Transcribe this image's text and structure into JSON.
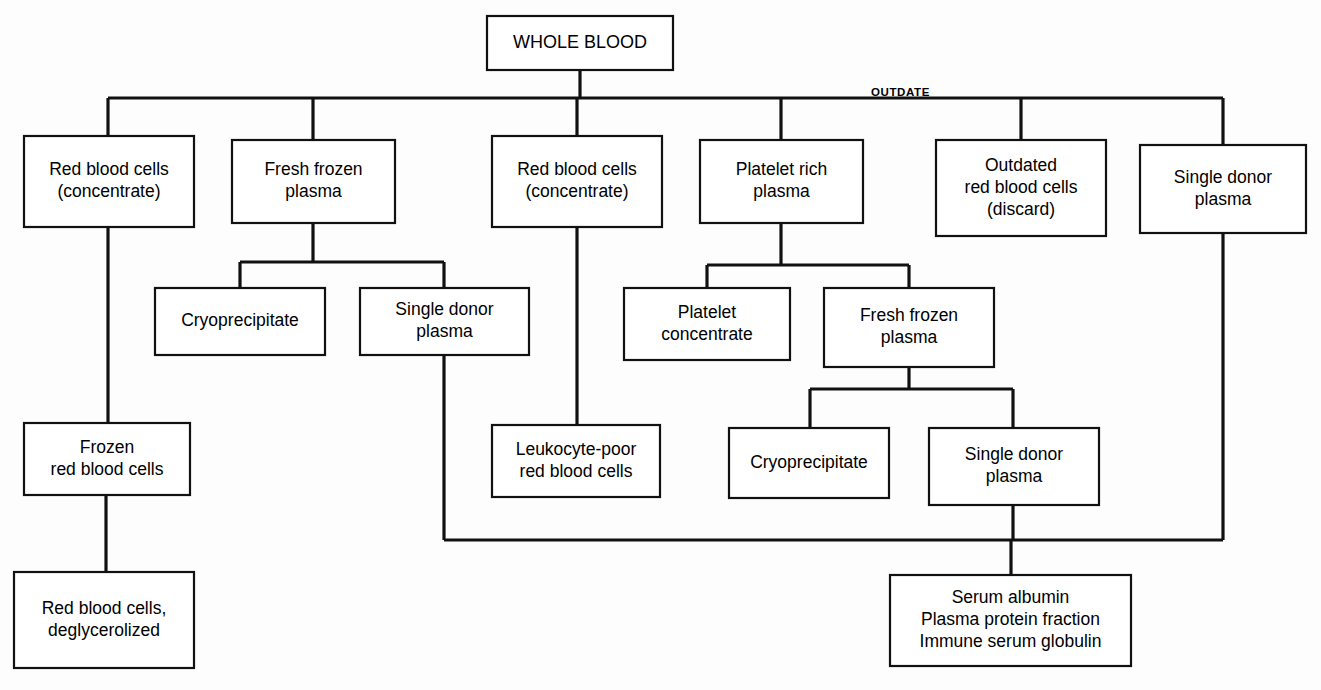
{
  "diagram": {
    "edge_labels": [
      {
        "id": "outdate",
        "text": "OUTDATE",
        "x": 871,
        "y": 96
      }
    ],
    "nodes": [
      {
        "id": "whole-blood",
        "lines": [
          "WHOLE BLOOD"
        ],
        "x": 487,
        "y": 16,
        "w": 186,
        "h": 54,
        "root": true
      },
      {
        "id": "rbc-concentrate-left",
        "lines": [
          "Red blood cells",
          "(concentrate)"
        ],
        "x": 24,
        "y": 136,
        "w": 170,
        "h": 91
      },
      {
        "id": "fresh-frozen-plasma-1",
        "lines": [
          "Fresh frozen",
          "plasma"
        ],
        "x": 232,
        "y": 140,
        "w": 163,
        "h": 83
      },
      {
        "id": "rbc-concentrate-mid",
        "lines": [
          "Red blood cells",
          "(concentrate)"
        ],
        "x": 492,
        "y": 136,
        "w": 170,
        "h": 91
      },
      {
        "id": "platelet-rich-plasma",
        "lines": [
          "Platelet rich",
          "plasma"
        ],
        "x": 700,
        "y": 140,
        "w": 163,
        "h": 83
      },
      {
        "id": "outdated-rbc-discard",
        "lines": [
          "Outdated",
          "red blood cells",
          "(discard)"
        ],
        "x": 936,
        "y": 140,
        "w": 170,
        "h": 96
      },
      {
        "id": "single-donor-plasma-r",
        "lines": [
          "Single donor",
          "plasma"
        ],
        "x": 1140,
        "y": 145,
        "w": 166,
        "h": 88
      },
      {
        "id": "cryoprecipitate-1",
        "lines": [
          "Cryoprecipitate"
        ],
        "x": 155,
        "y": 288,
        "w": 170,
        "h": 67
      },
      {
        "id": "single-donor-plasma-1",
        "lines": [
          "Single donor",
          "plasma"
        ],
        "x": 360,
        "y": 288,
        "w": 169,
        "h": 67
      },
      {
        "id": "platelet-concentrate",
        "lines": [
          "Platelet",
          "concentrate"
        ],
        "x": 624,
        "y": 288,
        "w": 166,
        "h": 72
      },
      {
        "id": "fresh-frozen-plasma-2",
        "lines": [
          "Fresh frozen",
          "plasma"
        ],
        "x": 824,
        "y": 288,
        "w": 170,
        "h": 79
      },
      {
        "id": "frozen-rbc",
        "lines": [
          "Frozen",
          "red blood cells"
        ],
        "x": 24,
        "y": 423,
        "w": 166,
        "h": 72
      },
      {
        "id": "leukocyte-poor-rbc",
        "lines": [
          "Leukocyte-poor",
          "red blood cells"
        ],
        "x": 492,
        "y": 425,
        "w": 168,
        "h": 72
      },
      {
        "id": "cryoprecipitate-2",
        "lines": [
          "Cryoprecipitate"
        ],
        "x": 729,
        "y": 428,
        "w": 160,
        "h": 70
      },
      {
        "id": "single-donor-plasma-2",
        "lines": [
          "Single donor",
          "plasma"
        ],
        "x": 929,
        "y": 428,
        "w": 170,
        "h": 77
      },
      {
        "id": "rbc-deglycerolized",
        "lines": [
          "Red blood cells,",
          "deglycerolized"
        ],
        "x": 14,
        "y": 572,
        "w": 180,
        "h": 96
      },
      {
        "id": "plasma-derivatives",
        "lines": [
          "Serum albumin",
          "Plasma protein fraction",
          "Immune serum globulin"
        ],
        "x": 890,
        "y": 575,
        "w": 241,
        "h": 91
      }
    ],
    "edges": [
      {
        "id": "whole-blood-to-bus",
        "points": "580,70 580,98"
      },
      {
        "id": "top-bus",
        "points": "108,98 1223,98"
      },
      {
        "id": "bus-to-rbc-left",
        "points": "108,98 108,136"
      },
      {
        "id": "bus-to-ffp1",
        "points": "313,98 313,140"
      },
      {
        "id": "bus-to-rbc-mid",
        "points": "577,98 577,136"
      },
      {
        "id": "bus-to-prp",
        "points": "781,98 781,140"
      },
      {
        "id": "bus-to-outdated",
        "points": "1021,98 1021,140"
      },
      {
        "id": "bus-to-sdp-right",
        "points": "1223,98 1223,145"
      },
      {
        "id": "rbc-left-to-frozen",
        "points": "108,227 108,423"
      },
      {
        "id": "frozen-to-deglycerolized",
        "points": "106,495 106,572"
      },
      {
        "id": "ffp1-to-split",
        "points": "313,223 313,262"
      },
      {
        "id": "ffp1-split-bar",
        "points": "240,262 444,262"
      },
      {
        "id": "split-to-cryo1",
        "points": "240,262 240,288"
      },
      {
        "id": "split-to-sdp1",
        "points": "444,262 444,288"
      },
      {
        "id": "rbc-mid-to-leukocyte",
        "points": "577,227 577,425"
      },
      {
        "id": "prp-to-split",
        "points": "781,223 781,265"
      },
      {
        "id": "prp-split-bar",
        "points": "707,265 909,265"
      },
      {
        "id": "split-to-platelet-conc",
        "points": "707,265 707,288"
      },
      {
        "id": "split-to-ffp2",
        "points": "909,265 909,288"
      },
      {
        "id": "ffp2-to-split",
        "points": "909,367 909,389"
      },
      {
        "id": "ffp2-split-bar",
        "points": "810,389 1013,389"
      },
      {
        "id": "split-to-cryo2",
        "points": "810,389 810,428"
      },
      {
        "id": "split-to-sdp2",
        "points": "1013,389 1013,428"
      },
      {
        "id": "sdp1-down-to-bottom-bus",
        "points": "444,355 444,540"
      },
      {
        "id": "bottom-bus",
        "points": "444,540 1223,540"
      },
      {
        "id": "sdp-right-down-to-bottom-bus",
        "points": "1223,233 1223,540"
      },
      {
        "id": "sdp2-down-to-bottom-bus",
        "points": "1013,505 1013,540"
      },
      {
        "id": "bottom-bus-to-derivatives",
        "points": "1011,540 1011,575"
      }
    ]
  }
}
